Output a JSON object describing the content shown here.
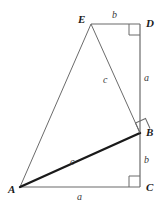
{
  "figure": {
    "width": 167,
    "height": 207,
    "background": "#ffffff",
    "stroke_color": "#555555",
    "bold_stroke_color": "#1a1a1a",
    "label_color": "#1a1a1a",
    "vertices": [
      {
        "name": "A",
        "label": "A",
        "x": 20,
        "y": 187,
        "label_x": 9,
        "label_y": 185
      },
      {
        "name": "B",
        "label": "B",
        "x": 140,
        "y": 133,
        "label_x": 146,
        "label_y": 127
      },
      {
        "name": "C",
        "label": "C",
        "x": 140,
        "y": 187,
        "label_x": 146,
        "label_y": 182
      },
      {
        "name": "D",
        "label": "D",
        "x": 140,
        "y": 24,
        "label_x": 146,
        "label_y": 18
      },
      {
        "name": "E",
        "label": "E",
        "x": 91,
        "y": 24,
        "label_x": 78,
        "label_y": 14
      }
    ],
    "segments": [
      {
        "name": "segment-A-C",
        "from": "A",
        "to": "C",
        "label": "a",
        "label_x": 77,
        "label_y": 193,
        "bold": false
      },
      {
        "name": "segment-C-B",
        "from": "C",
        "to": "B",
        "label": "b",
        "label_x": 144,
        "label_y": 155,
        "bold": false
      },
      {
        "name": "segment-B-D",
        "from": "B",
        "to": "D",
        "label": "a",
        "label_x": 144,
        "label_y": 73,
        "bold": false
      },
      {
        "name": "segment-D-E",
        "from": "D",
        "to": "E",
        "label": "b",
        "label_x": 112,
        "label_y": 10,
        "bold": false
      },
      {
        "name": "segment-E-A",
        "from": "E",
        "to": "A",
        "label": "",
        "label_x": 0,
        "label_y": 0,
        "bold": false
      },
      {
        "name": "segment-E-B",
        "from": "E",
        "to": "B",
        "label": "c",
        "label_x": 103,
        "label_y": 75,
        "bold": false
      },
      {
        "name": "segment-A-B",
        "from": "A",
        "to": "B",
        "label": "c",
        "label_x": 70,
        "label_y": 157,
        "bold": true
      }
    ],
    "right_angles": [
      {
        "name": "right-angle-at-D",
        "vertex": "D",
        "size": 10,
        "rotation": 0
      },
      {
        "name": "right-angle-at-C",
        "vertex": "C",
        "size": 10,
        "rotation": 0
      },
      {
        "name": "right-angle-at-B",
        "vertex": "B",
        "size": 10,
        "rotation": 24
      }
    ]
  }
}
